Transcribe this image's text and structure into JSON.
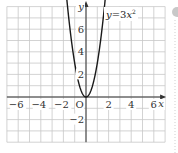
{
  "chart_data": {
    "type": "line",
    "title": "",
    "xlabel": "x",
    "ylabel": "y",
    "origin_label": "O",
    "xlim": [
      -7,
      7
    ],
    "ylim": [
      -4,
      8
    ],
    "grid": true,
    "grid_step": 1,
    "x_ticks": [
      -6,
      -4,
      -2,
      2,
      4,
      6
    ],
    "x_tick_labels": [
      "−6",
      "−4",
      "−2",
      "2",
      "4",
      "6"
    ],
    "y_ticks": [
      -2,
      2,
      4,
      6
    ],
    "y_tick_labels": [
      "−2",
      "2",
      "4",
      "6"
    ],
    "series": [
      {
        "name": "y=3x²",
        "equation": "y = 3x^2",
        "x": [
          -1.633,
          -1.5,
          -1.25,
          -1,
          -0.75,
          -0.5,
          -0.25,
          0,
          0.25,
          0.5,
          0.75,
          1,
          1.25,
          1.5,
          1.633
        ],
        "y": [
          8,
          6.75,
          4.6875,
          3,
          1.6875,
          0.75,
          0.1875,
          0,
          0.1875,
          0.75,
          1.6875,
          3,
          4.6875,
          6.75,
          8
        ]
      }
    ],
    "annotations": [
      {
        "text": "y=3x²",
        "x": 2.1,
        "y": 7.2
      }
    ],
    "legend": "none",
    "colors": {
      "grid": "#c8c8c8",
      "axis": "#333333",
      "curve": "#1a1a1a"
    }
  },
  "labels": {
    "curve_label_y": "y",
    "curve_label_eq": "=3",
    "curve_label_x": "x",
    "curve_label_exp": "2"
  }
}
